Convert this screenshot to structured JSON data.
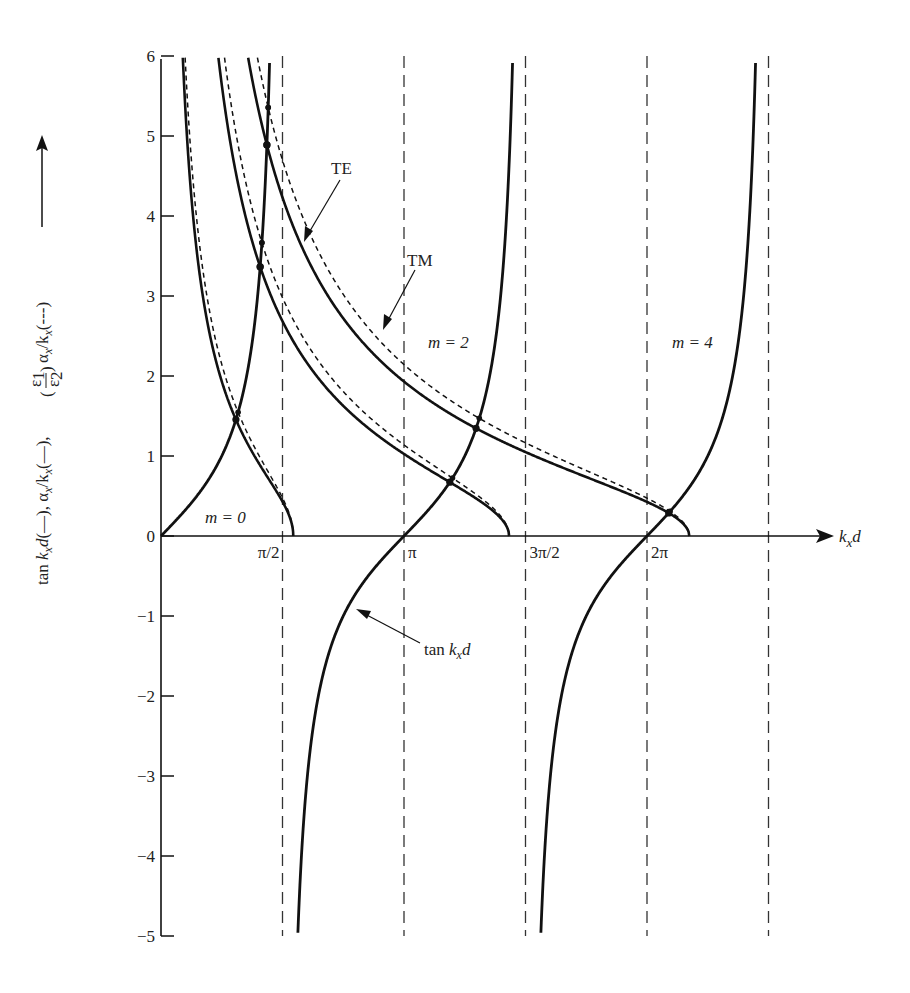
{
  "chart_data": {
    "type": "line",
    "title": "",
    "xlabel": "k_x d",
    "ylabel": "tan k_x d(—), α_x/k_x(—), (ε1/ε2) α_x/k_x(---)",
    "ylabel_parts": {
      "part1": "tan ",
      "kx": "k",
      "x_sub": "x",
      "d": "d",
      "p2": "(—), α",
      "p3": "/k",
      "p4": "(—), ",
      "p5": " α",
      "p6": "/k",
      "p7": "(---)",
      "eps1": "ε",
      "eps2": "ε",
      "one": "1",
      "two": "2"
    },
    "xlabel_parts": {
      "k": "k",
      "sub": "x",
      "d": "d"
    },
    "xlim": [
      0,
      8.4
    ],
    "ylim": [
      -5,
      6
    ],
    "grid": false,
    "x_ticks": [
      {
        "value": 1.5708,
        "label": "π/2"
      },
      {
        "value": 3.1416,
        "label": "π"
      },
      {
        "value": 4.7124,
        "label": "3π/2"
      },
      {
        "value": 6.2832,
        "label": "2π"
      }
    ],
    "y_ticks": [
      {
        "value": 6,
        "label": "6"
      },
      {
        "value": 5,
        "label": "5"
      },
      {
        "value": 4,
        "label": "4"
      },
      {
        "value": 3,
        "label": "3"
      },
      {
        "value": 2,
        "label": "2"
      },
      {
        "value": 1,
        "label": "1"
      },
      {
        "value": 0,
        "label": "0"
      },
      {
        "value": -1,
        "label": "−1"
      },
      {
        "value": -2,
        "label": "−2"
      },
      {
        "value": -3,
        "label": "−3"
      },
      {
        "value": -4,
        "label": "−4"
      },
      {
        "value": -5,
        "label": "−5"
      }
    ],
    "asymptotes_dashed": [
      1.5708,
      3.1416,
      4.7124,
      6.2832,
      7.854
    ],
    "series": [
      {
        "name": "tan k_x d",
        "style": "solid",
        "function": "tan(u)"
      },
      {
        "name": "α_x/k_x (TE), V=1.71",
        "style": "solid",
        "V": 1.71,
        "scale": 1.0
      },
      {
        "name": "α_x/k_x (TE), V=4.50",
        "style": "solid",
        "V": 4.5,
        "scale": 1.0
      },
      {
        "name": "α_x/k_x (TE), V=6.83",
        "style": "solid",
        "V": 6.83,
        "scale": 1.0
      },
      {
        "name": "(ε1/ε2) α_x/k_x (TM), V=1.71",
        "style": "dashed",
        "V": 1.71,
        "scale": 1.11
      },
      {
        "name": "(ε1/ε2) α_x/k_x (TM), V=4.50",
        "style": "dashed",
        "V": 4.5,
        "scale": 1.11
      },
      {
        "name": "(ε1/ε2) α_x/k_x (TM), V=6.83",
        "style": "dashed",
        "V": 6.83,
        "scale": 1.11
      }
    ],
    "intersections": [
      {
        "x": 0.98,
        "y": 1.49,
        "mode": "m=0"
      },
      {
        "x": 3.79,
        "y": 0.72,
        "mode": "m=2"
      },
      {
        "x": 4.09,
        "y": 1.34,
        "mode": "m=2"
      },
      {
        "x": 6.59,
        "y": 0.32,
        "mode": "m=4"
      }
    ],
    "annotations": [
      {
        "text": "m = 0",
        "x": 0.55,
        "y": 0.25
      },
      {
        "text": "m = 2",
        "x": 3.5,
        "y": 2.45
      },
      {
        "text": "m = 4",
        "x": 6.85,
        "y": 2.45
      },
      {
        "text": "TE",
        "arrow_to": [
          1.82,
          3.68
        ]
      },
      {
        "text": "TM",
        "arrow_to": [
          2.86,
          2.57
        ]
      },
      {
        "text": "tan k_x d",
        "arrow_to": [
          2.52,
          -0.92
        ]
      }
    ]
  },
  "labels": {
    "m0": "m = 0",
    "m2": "m = 2",
    "m4": "m = 4",
    "te": "TE",
    "tm": "TM",
    "tan_label_prefix": "tan ",
    "tan_label_k": "k",
    "tan_label_sub": "x",
    "tan_label_d": "d"
  },
  "colors": {
    "ink": "#111111",
    "dash": "#333333",
    "background": "#ffffff"
  }
}
